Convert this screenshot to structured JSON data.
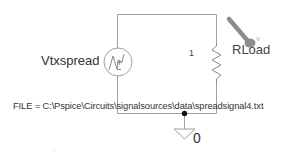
{
  "schematic": {
    "source": {
      "name": "Vtxspread",
      "symbol": "voltage-source-file-icon",
      "file_attribute": "FILE = C:\\Pspice\\Circuits\\signalsources\\data\\spreadsignal4.txt"
    },
    "resistor": {
      "name": "RLoad",
      "value": "1"
    },
    "ground": {
      "name": "0"
    },
    "probe": {
      "type": "voltage-probe",
      "marker": "V"
    },
    "colors": {
      "wire": "#9a9a9a",
      "text": "#333333",
      "probe": "#8c8c8c",
      "junction": "#111111"
    }
  }
}
